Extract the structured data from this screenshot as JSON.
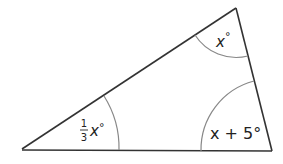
{
  "diagram": {
    "type": "triangle",
    "colors": {
      "line": "#333333",
      "arc": "#888888",
      "text": "#222222"
    },
    "vertices": {
      "left": {
        "x": 22,
        "y": 149
      },
      "top": {
        "x": 236,
        "y": 8
      },
      "right": {
        "x": 272,
        "y": 151
      }
    },
    "angles": [
      {
        "vertex": "left",
        "label_fraction_num": "1",
        "label_fraction_den": "3",
        "label_var": "x",
        "label_degree": "°"
      },
      {
        "vertex": "top",
        "label_var": "x",
        "label_degree": "°"
      },
      {
        "vertex": "right",
        "label_text": "x + 5°"
      }
    ]
  }
}
